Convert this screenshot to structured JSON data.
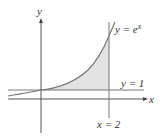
{
  "diagram": {
    "axes": {
      "x_label": "x",
      "y_label": "y"
    },
    "curves": [
      {
        "name": "exponential",
        "label_prefix": "y = ",
        "label_base": "e",
        "label_exp": "x"
      },
      {
        "name": "horizontal-line",
        "label": "y = 1"
      },
      {
        "name": "vertical-line",
        "label": "x = 2"
      }
    ],
    "shaded_region": {
      "description": "Area between y = e^x and y = 1 from x = 0 to x = 2",
      "fill": "#e3e3e3"
    },
    "colors": {
      "axis": "#444444",
      "curve": "#777777",
      "shade": "#e3e3e3"
    }
  }
}
